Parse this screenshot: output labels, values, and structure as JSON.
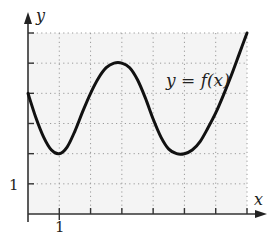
{
  "chart_data": {
    "type": "line",
    "title": "",
    "xlabel": "x",
    "ylabel": "y",
    "xlim": [
      0,
      7
    ],
    "ylim": [
      0,
      6
    ],
    "grid": true,
    "x_tick_labels": [
      {
        "value": 1,
        "label": "1"
      }
    ],
    "y_tick_labels": [
      {
        "value": 1,
        "label": "1"
      }
    ],
    "annotations": [
      {
        "text": "y = f(x)",
        "x": 5.8,
        "y": 4.2
      }
    ],
    "series": [
      {
        "name": "y = f(x)",
        "x": [
          0,
          0.25,
          0.5,
          0.75,
          1,
          1.25,
          1.5,
          1.75,
          2,
          2.25,
          2.5,
          2.75,
          3,
          3.25,
          3.5,
          3.75,
          4,
          4.25,
          4.5,
          4.75,
          5,
          5.25,
          5.5,
          5.75,
          6,
          6.25,
          6.5,
          6.75,
          7
        ],
        "y": [
          4,
          3.2,
          2.55,
          2.12,
          2,
          2.22,
          2.75,
          3.4,
          4.0,
          4.5,
          4.85,
          5.0,
          5.0,
          4.85,
          4.45,
          3.85,
          3.15,
          2.55,
          2.15,
          2.0,
          2.0,
          2.12,
          2.4,
          2.85,
          3.35,
          3.95,
          4.6,
          5.3,
          6.0
        ]
      }
    ]
  },
  "labels": {
    "x_axis": "x",
    "y_axis": "y",
    "x_tick": "1",
    "y_tick": "1",
    "curve": "y = f(x)"
  }
}
